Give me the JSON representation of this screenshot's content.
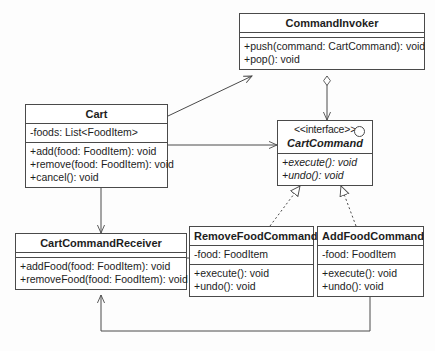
{
  "diagram": {
    "kind": "uml-class-diagram",
    "background_color": "#fdfdfd",
    "line_color": "#4a4a4a",
    "text_color": "#1d1d1d"
  },
  "classes": {
    "command_invoker": {
      "name": "CommandInvoker",
      "attributes": [],
      "methods": [
        "+push(command: CartCommand): void",
        "+pop(): void"
      ]
    },
    "cart": {
      "name": "Cart",
      "attributes": [
        "-foods: List<FoodItem>"
      ],
      "methods": [
        "+add(food: FoodItem): void",
        "+remove(food: FoodItem): void",
        "+cancel(): void"
      ]
    },
    "cart_command": {
      "stereotype": "<<interface>>",
      "name": "CartCommand",
      "methods": [
        "+execute(): void",
        "+undo(): void"
      ]
    },
    "cart_command_receiver": {
      "name": "CartCommandReceiver",
      "attributes": [],
      "methods": [
        "+addFood(food: FoodItem): void",
        "+removeFood(food: FoodItem): void"
      ]
    },
    "remove_food_command": {
      "name": "RemoveFoodCommand",
      "attributes": [
        "-food: FoodItem"
      ],
      "methods": [
        "+execute(): void",
        "+undo(): void"
      ]
    },
    "add_food_command": {
      "name": "AddFoodCommand",
      "attributes": [
        "-food: FoodItem"
      ],
      "methods": [
        "+execute(): void",
        "+undo(): void"
      ]
    }
  },
  "relationships": [
    {
      "from": "Cart",
      "to": "CommandInvoker",
      "type": "association",
      "arrow": "open"
    },
    {
      "from": "CommandInvoker",
      "to": "CartCommand",
      "type": "aggregation",
      "arrow": "open",
      "diamond": "hollow"
    },
    {
      "from": "Cart",
      "to": "CartCommand",
      "type": "association",
      "arrow": "open"
    },
    {
      "from": "Cart",
      "to": "CartCommandReceiver",
      "type": "association",
      "arrow": "open"
    },
    {
      "from": "RemoveFoodCommand",
      "to": "CartCommand",
      "type": "realization",
      "arrow": "hollow-triangle",
      "line": "dashed"
    },
    {
      "from": "AddFoodCommand",
      "to": "CartCommand",
      "type": "realization",
      "arrow": "hollow-triangle",
      "line": "dashed"
    },
    {
      "from": "RemoveFoodCommand",
      "to": "CartCommandReceiver",
      "type": "association",
      "arrow": "open"
    },
    {
      "from": "AddFoodCommand",
      "to": "CartCommandReceiver",
      "type": "association",
      "arrow": "open"
    }
  ]
}
